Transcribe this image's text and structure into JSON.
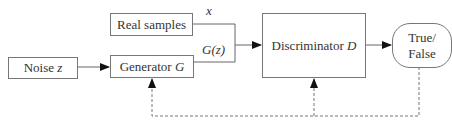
{
  "diagram": {
    "nodes": {
      "noise": {
        "label": "Noise",
        "var": "z"
      },
      "real_samples": {
        "label": "Real samples"
      },
      "generator": {
        "label": "Generator",
        "var": "G"
      },
      "discriminator": {
        "label": "Discriminator",
        "var": "D"
      },
      "output": {
        "line1": "True/",
        "line2": "False"
      }
    },
    "edge_labels": {
      "real": "x",
      "fake": "G(z)"
    },
    "edges": [
      {
        "from": "noise",
        "to": "generator",
        "style": "solid"
      },
      {
        "from": "real_samples",
        "to": "discriminator",
        "label": "x",
        "style": "solid"
      },
      {
        "from": "generator",
        "to": "discriminator",
        "label": "G(z)",
        "style": "solid"
      },
      {
        "from": "discriminator",
        "to": "output",
        "style": "solid"
      },
      {
        "from": "output",
        "to": "discriminator",
        "style": "dashed",
        "role": "feedback"
      },
      {
        "from": "output",
        "to": "generator",
        "style": "dashed",
        "role": "feedback"
      }
    ],
    "colors": {
      "stroke": "#777777",
      "text": "#333333",
      "background": "#ffffff"
    }
  }
}
